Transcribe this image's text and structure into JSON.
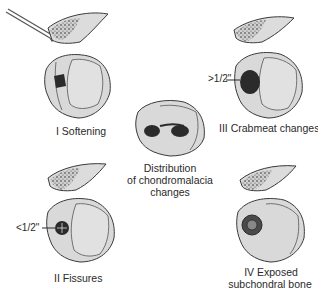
{
  "diagram": {
    "stages": [
      {
        "grade": "I",
        "label": "I  Softening"
      },
      {
        "grade": "II",
        "label": "II  Fissures",
        "measure": "<1/2\""
      },
      {
        "grade": "III",
        "label": "III  Crabmeat changes",
        "measure": ">1/2\""
      },
      {
        "grade": "IV",
        "label_line1": "IV  Exposed",
        "label_line2": "subchondral bone"
      }
    ],
    "center": {
      "line1": "Distribution",
      "line2": "of chondromalacia",
      "line3": "changes"
    },
    "colors": {
      "cartilage": "#d9d9d9",
      "outline": "#3a3a3a",
      "lesion": "#2b2b2b",
      "background": "#ffffff"
    }
  }
}
